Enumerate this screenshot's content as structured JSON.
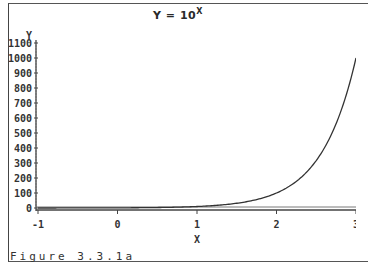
{
  "chart_data": {
    "type": "line",
    "title_base": "Y = 10",
    "title_sup": "X",
    "xlabel": "X",
    "ylabel": "Y",
    "xlim": [
      -1,
      3
    ],
    "ylim": [
      0,
      1100
    ],
    "x_ticks": [
      "-1",
      "0",
      "1",
      "2",
      "3"
    ],
    "y_ticks": [
      "0",
      "100",
      "200",
      "300",
      "400",
      "500",
      "600",
      "700",
      "800",
      "900",
      "1000",
      "1100"
    ],
    "grid": false,
    "series": [
      {
        "name": "Y = 10^X",
        "x": [
          -1,
          -0.5,
          0,
          0.5,
          1,
          1.25,
          1.5,
          1.75,
          2,
          2.25,
          2.5,
          2.75,
          3
        ],
        "values": [
          0.1,
          0.32,
          1,
          3.16,
          10,
          17.8,
          31.6,
          56.2,
          100,
          177.8,
          316.2,
          562.3,
          1000
        ]
      }
    ],
    "caption": "Figure 3.3.1a"
  }
}
